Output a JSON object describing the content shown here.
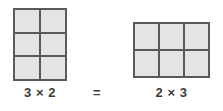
{
  "figure": {
    "background_color": "#ffffff",
    "cell_fill_color": "#e4e4e4",
    "grid_line_color": "#58595b",
    "text_color": "#3b3b3d",
    "equals_label": "=",
    "left": {
      "columns": 2,
      "rows": 3,
      "cell_count": 6,
      "label": "3 × 2"
    },
    "right": {
      "columns": 3,
      "rows": 2,
      "cell_count": 6,
      "label": "2 × 3"
    }
  }
}
